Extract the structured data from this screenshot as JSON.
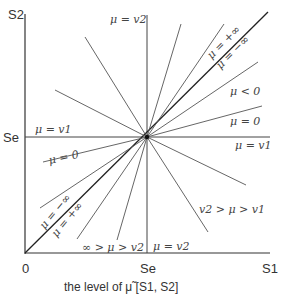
{
  "diagram": {
    "axes": {
      "y_label": "S2",
      "x_label": "S1",
      "origin_label": "0",
      "se_x_label": "Se",
      "se_y_label": "Se"
    },
    "caption": "the level of μ̃ [S1, S2]",
    "center_point": [
      147,
      137
    ],
    "line_labels": {
      "mu_v2_top": "μ = v2",
      "mu_v1_left": "μ = v1",
      "mu_pos_inf_upper": "μ = +∞",
      "mu_neg_inf_upper": "μ = −∞",
      "mu_lt_0": "μ < 0",
      "mu_0_right": "μ = 0",
      "mu_v1_right": "μ = v1",
      "mu_0_left": "μ = 0",
      "mu_neg_inf_lower": "μ = −∞",
      "mu_pos_inf_lower": "μ = +∞",
      "inf_gt_mu_gt_v2": "∞ > μ > v2",
      "mu_v2_bottom": "μ = v2",
      "v2_gt_mu_gt_v1": "v2 > μ > v1"
    },
    "colors": {
      "line": "#555555",
      "axis": "#333333",
      "diagonal": "#222222"
    }
  }
}
